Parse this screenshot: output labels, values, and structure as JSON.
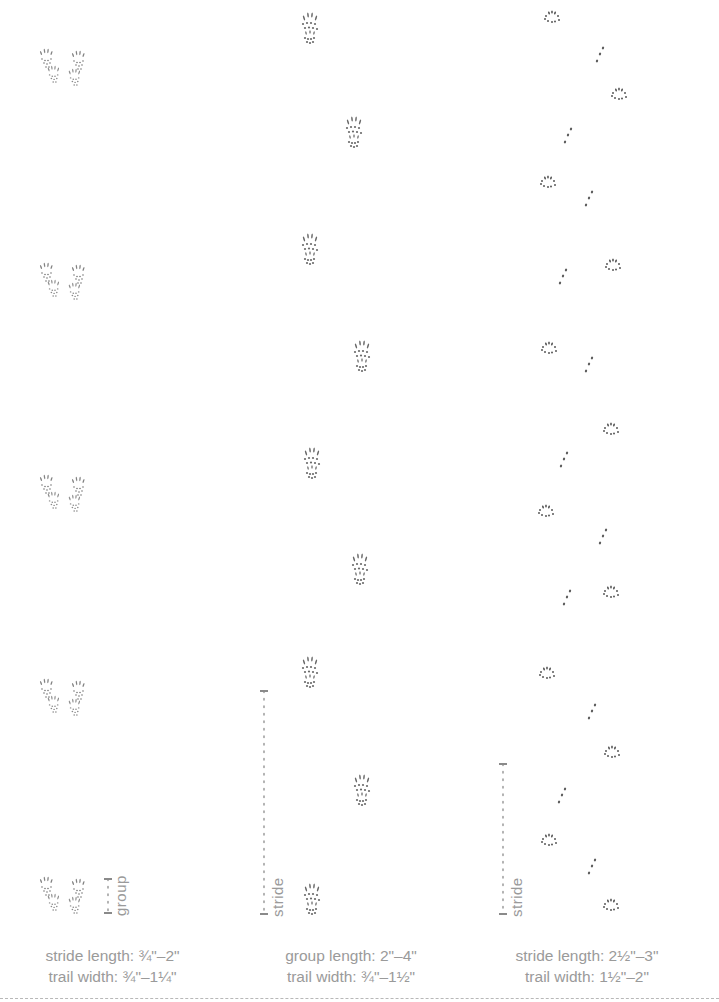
{
  "diagram": {
    "title": "",
    "background": "#ffffff",
    "ink_color": "#5a5a5a",
    "caption_color": "#9a9a9a",
    "columns": [
      {
        "id": "bounding-pattern",
        "caption": {
          "line1": "stride length: ¾\"–2\"",
          "line2": "trail width: ¾\"–1¼\""
        },
        "measure": {
          "label": "group",
          "x": 108,
          "y_top": 878,
          "y_bottom": 912
        },
        "groups": [
          {
            "y": 48
          },
          {
            "y": 262
          },
          {
            "y": 474
          },
          {
            "y": 678
          },
          {
            "y": 876
          }
        ]
      },
      {
        "id": "walking-pattern",
        "caption": {
          "line1": "group length: 2\"–4\"",
          "line2": "trail width: ¾\"–1½\""
        },
        "measure": {
          "label": "stride",
          "x": 264,
          "y_top": 690,
          "y_bottom": 913
        },
        "prints": [
          {
            "x": 298,
            "y": 12
          },
          {
            "x": 342,
            "y": 116
          },
          {
            "x": 298,
            "y": 233
          },
          {
            "x": 350,
            "y": 340
          },
          {
            "x": 300,
            "y": 447
          },
          {
            "x": 348,
            "y": 553
          },
          {
            "x": 298,
            "y": 656
          },
          {
            "x": 350,
            "y": 774
          },
          {
            "x": 300,
            "y": 883
          }
        ]
      },
      {
        "id": "zigzag-pattern",
        "caption": {
          "line1": "stride length: 2½\"–3\"",
          "line2": "trail width: 1½\"–2\""
        },
        "measure": {
          "label": "stride",
          "x": 503,
          "y_top": 763,
          "y_bottom": 913
        },
        "prints": [
          {
            "type": "pad",
            "x": 543,
            "y": 10
          },
          {
            "type": "toe",
            "x": 594,
            "y": 46
          },
          {
            "type": "pad",
            "x": 610,
            "y": 87
          },
          {
            "type": "toe",
            "x": 562,
            "y": 127
          },
          {
            "type": "pad",
            "x": 539,
            "y": 175
          },
          {
            "type": "toe",
            "x": 583,
            "y": 190
          },
          {
            "type": "pad",
            "x": 604,
            "y": 258
          },
          {
            "type": "toe",
            "x": 557,
            "y": 268
          },
          {
            "type": "pad",
            "x": 540,
            "y": 341
          },
          {
            "type": "toe",
            "x": 583,
            "y": 356
          },
          {
            "type": "pad",
            "x": 602,
            "y": 422
          },
          {
            "type": "toe",
            "x": 558,
            "y": 451
          },
          {
            "type": "pad",
            "x": 537,
            "y": 504
          },
          {
            "type": "toe",
            "x": 597,
            "y": 528
          },
          {
            "type": "pad",
            "x": 602,
            "y": 585
          },
          {
            "type": "toe",
            "x": 561,
            "y": 589
          },
          {
            "type": "pad",
            "x": 538,
            "y": 666
          },
          {
            "type": "toe",
            "x": 586,
            "y": 703
          },
          {
            "type": "pad",
            "x": 603,
            "y": 745
          },
          {
            "type": "toe",
            "x": 556,
            "y": 787
          },
          {
            "type": "pad",
            "x": 540,
            "y": 833
          },
          {
            "type": "toe",
            "x": 586,
            "y": 858
          },
          {
            "type": "pad",
            "x": 602,
            "y": 898
          }
        ]
      }
    ]
  }
}
